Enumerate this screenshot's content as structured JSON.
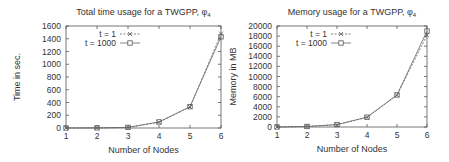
{
  "chart_data": [
    {
      "type": "line",
      "title": "Total time usage for a TWGPP, φ",
      "title_subscript": "4",
      "xlabel": "Number of Nodes",
      "ylabel": "Time in sec.",
      "xlim": [
        1,
        6
      ],
      "ylim": [
        0,
        1600
      ],
      "xticks": [
        "1",
        "2",
        "3",
        "4",
        "5",
        "6"
      ],
      "yticks": [
        "0",
        "200",
        "400",
        "600",
        "800",
        "1000",
        "1200",
        "1400",
        "1600"
      ],
      "x": [
        1,
        2,
        3,
        4,
        5,
        6
      ],
      "series": [
        {
          "name": "t = 1",
          "marker": "x",
          "line": "dashed",
          "values": [
            0,
            2,
            8,
            90,
            330,
            1480
          ]
        },
        {
          "name": "t = 1000",
          "marker": "square",
          "line": "solid",
          "values": [
            0,
            2,
            10,
            95,
            335,
            1430
          ]
        }
      ],
      "legend_position": "upper left",
      "grid": false
    },
    {
      "type": "line",
      "title": "Memory usage for a TWGPP, φ",
      "title_subscript": "4",
      "xlabel": "Number of Nodes",
      "ylabel": "Memory in MB",
      "xlim": [
        1,
        6
      ],
      "ylim": [
        0,
        20000
      ],
      "xticks": [
        "1",
        "2",
        "3",
        "4",
        "5",
        "6"
      ],
      "yticks": [
        "0",
        "2000",
        "4000",
        "6000",
        "8000",
        "10000",
        "12000",
        "14000",
        "16000",
        "18000",
        "20000"
      ],
      "x": [
        1,
        2,
        3,
        4,
        5,
        6
      ],
      "series": [
        {
          "name": "t = 1",
          "marker": "x",
          "line": "dashed",
          "values": [
            0,
            100,
            450,
            1900,
            6300,
            18200
          ]
        },
        {
          "name": "t = 1000",
          "marker": "square",
          "line": "solid",
          "values": [
            0,
            110,
            480,
            1950,
            6350,
            19000
          ]
        }
      ],
      "legend_position": "upper left",
      "grid": false
    }
  ]
}
